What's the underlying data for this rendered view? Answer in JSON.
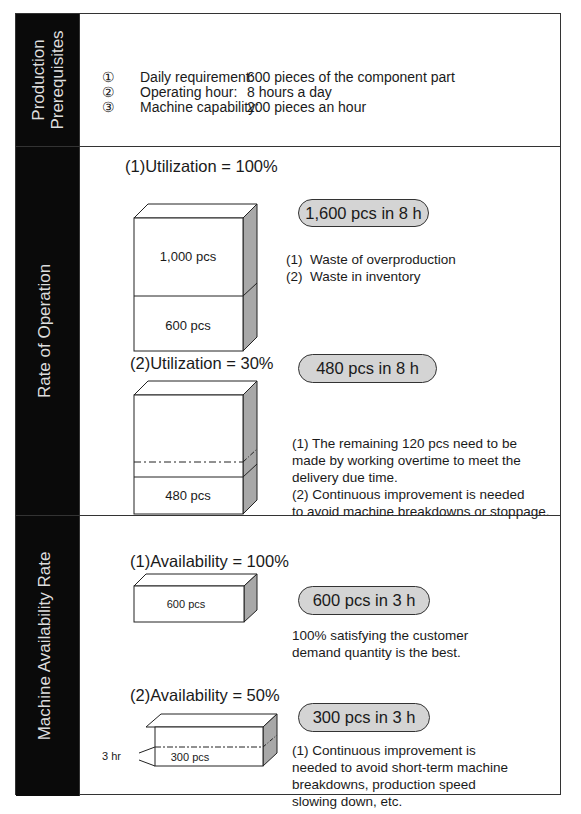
{
  "sections": {
    "prerequisites": {
      "side_label_line1": "Production",
      "side_label_line2": "Prerequisites",
      "items": [
        {
          "num": "①",
          "label": "Daily requirement:",
          "value": "600 pieces of the component part"
        },
        {
          "num": "②",
          "label": "Operating hour:",
          "value": "8 hours a day"
        },
        {
          "num": "③",
          "label": "Machine capability:",
          "value": "200 pieces an hour"
        }
      ]
    },
    "rate_of_operation": {
      "side_label": "Rate of Operation",
      "case1": {
        "heading": "(1)Utilization = 100%",
        "pill": "1,600 pcs in 8 h",
        "cube_upper": "1,000 pcs",
        "cube_lower": "600 pcs",
        "notes": [
          {
            "num": "(1)",
            "text": "Waste of overproduction"
          },
          {
            "num": "(2)",
            "text": "Waste in inventory"
          }
        ]
      },
      "case2": {
        "heading": "(2)Utilization = 30%",
        "pill": "480 pcs in 8 h",
        "cube_lower": "480 pcs",
        "notes": [
          "(1) The remaining 120 pcs need to be",
          "made by working overtime to meet the",
          "delivery due time.",
          "(2) Continuous improvement is needed",
          "to avoid machine breakdowns or stoppage."
        ]
      }
    },
    "availability": {
      "side_label": "Machine Availability Rate",
      "case1": {
        "heading": "(1)Availability = 100%",
        "pill": "600 pcs in 3 h",
        "cube_label": "600 pcs",
        "notes": [
          "100% satisfying the customer",
          "demand quantity is the best."
        ]
      },
      "case2": {
        "heading": "(2)Availability = 50%",
        "pill": "300 pcs in 3 h",
        "cube_label": "300 pcs",
        "side_marker": "3 hr",
        "notes": [
          "(1) Continuous improvement is",
          "needed to avoid short-term machine",
          "breakdowns, production speed",
          "slowing down, etc."
        ]
      }
    }
  },
  "colors": {
    "sidebar": "#0a0a0a",
    "sidebar_text": "#dddddd",
    "pill_fill": "#d4d4d4",
    "cube_side": "#a8a8a8",
    "border": "#333333"
  }
}
